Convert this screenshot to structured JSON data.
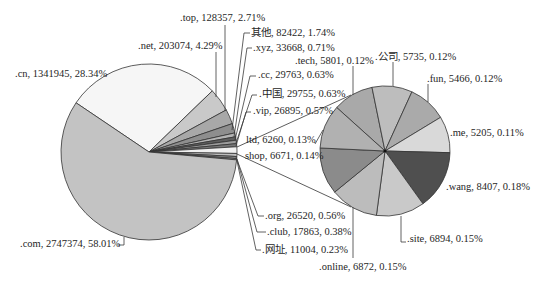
{
  "chart_data": {
    "type": "pie",
    "subtype": "pie-of-pie",
    "title": "",
    "label_format": "name, value, percent",
    "legend": "none",
    "main_pie": {
      "slices": [
        {
          "name": ".cn",
          "value": 1341945,
          "percent": "28.34%",
          "label": ".cn, 1341945, 28.34%",
          "color": "#f6f6f6"
        },
        {
          "name": ".net",
          "value": 203074,
          "percent": "4.29%",
          "label": ".net, 203074, 4.29%",
          "color": "#c9c9c9"
        },
        {
          "name": ".top",
          "value": 128357,
          "percent": "2.71%",
          "label": ".top, 128357, 2.71%",
          "color": "#a8a8a8"
        },
        {
          "name": "其他",
          "value": 82422,
          "percent": "1.74%",
          "label": "其他, 82422, 1.74%",
          "color": "#8e8e8e"
        },
        {
          "name": ".xyz",
          "value": 33668,
          "percent": "0.71%",
          "label": ".xyz, 33668, 0.71%",
          "color": "#b4b4b4"
        },
        {
          "name": ".cc",
          "value": 29763,
          "percent": "0.63%",
          "label": ".cc, 29763, 0.63%",
          "color": "#5e5e5e"
        },
        {
          "name": ".中国",
          "value": 29755,
          "percent": "0.63%",
          "label": ".中国, 29755, 0.63%",
          "color": "#9c9c9c"
        },
        {
          "name": ".vip",
          "value": 26895,
          "percent": "0.57%",
          "label": ".vip, 26895, 0.57%",
          "color": "#777777"
        },
        {
          "name": "",
          "group": true,
          "color": "#f0f0f0"
        },
        {
          "name": ".org",
          "value": 26520,
          "percent": "0.56%",
          "label": ".org, 26520, 0.56%",
          "color": "#bdbdbd"
        },
        {
          "name": ".club",
          "value": 17863,
          "percent": "0.38%",
          "label": ".club, 17863, 0.38%",
          "color": "#8a8a8a"
        },
        {
          "name": ".网址",
          "value": 11004,
          "percent": "0.23%",
          "label": ".网址, 11004, 0.23%",
          "color": "#a5a5a5"
        },
        {
          "name": ".com",
          "value": 2747374,
          "percent": "58.01%",
          "label": ".com, 2747374, 58.01%",
          "color": "#c3c3c3"
        }
      ]
    },
    "secondary_pie": {
      "slices": [
        {
          "name": ".tech",
          "value": 5801,
          "percent": "0.12%",
          "label": ".tech, 5801, 0.12%",
          "color": "#a9a9a9"
        },
        {
          "name": ".公司",
          "value": 5735,
          "percent": "0.12%",
          "label": ".公司, 5735, 0.12%",
          "color": "#bdbdbd"
        },
        {
          "name": ".fun",
          "value": 5466,
          "percent": "0.12%",
          "label": ".fun, 5466, 0.12%",
          "color": "#aaaaaa"
        },
        {
          "name": ".me",
          "value": 5205,
          "percent": "0.11%",
          "label": ".me, 5205, 0.11%",
          "color": "#d9d9d9"
        },
        {
          "name": ".wang",
          "value": 8407,
          "percent": "0.18%",
          "label": ".wang, 8407, 0.18%",
          "color": "#4f4f4f"
        },
        {
          "name": ".site",
          "value": 6894,
          "percent": "0.15%",
          "label": ".site, 6894, 0.15%",
          "color": "#c9c9c9"
        },
        {
          "name": ".online",
          "value": 6872,
          "percent": "0.15%",
          "label": ".online, 6872, 0.15%",
          "color": "#bcbcbc"
        },
        {
          "name": "shop",
          "value": 6671,
          "percent": "0.14%",
          "label": "shop, 6671, 0.14%",
          "color": "#8b8b8b"
        },
        {
          "name": "ltd",
          "value": 6260,
          "percent": "0.13%",
          "label": "ltd, 6260, 0.13%",
          "color": "#b1b1b1"
        }
      ]
    }
  }
}
